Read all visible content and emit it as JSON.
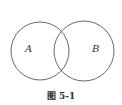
{
  "diagram": {
    "type": "venn",
    "sets": [
      {
        "label": "A",
        "cx": 40,
        "cy": 51,
        "r": 29
      },
      {
        "label": "B",
        "cx": 84,
        "cy": 51,
        "r": 30
      }
    ],
    "stroke_color": "#444444"
  },
  "caption": "图 5-1"
}
